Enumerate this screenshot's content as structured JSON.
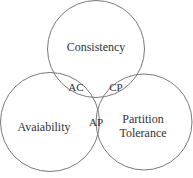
{
  "diagram": {
    "type": "venn",
    "stroke_color": "#777777",
    "text_color": "#333333",
    "sets": [
      {
        "id": "C",
        "label": "Consistency",
        "cx": 96,
        "cy": 49,
        "r": 49
      },
      {
        "id": "A",
        "label": "Avaiability",
        "cx": 50,
        "cy": 122,
        "r": 50
      },
      {
        "id": "P",
        "label_line1": "Partition",
        "label_line2": "Tolerance",
        "cx": 144,
        "cy": 122,
        "r": 48
      }
    ],
    "intersections": [
      {
        "id": "AC",
        "label": "AC"
      },
      {
        "id": "CP",
        "label": "CP"
      },
      {
        "id": "AP",
        "label": "AP"
      }
    ]
  }
}
